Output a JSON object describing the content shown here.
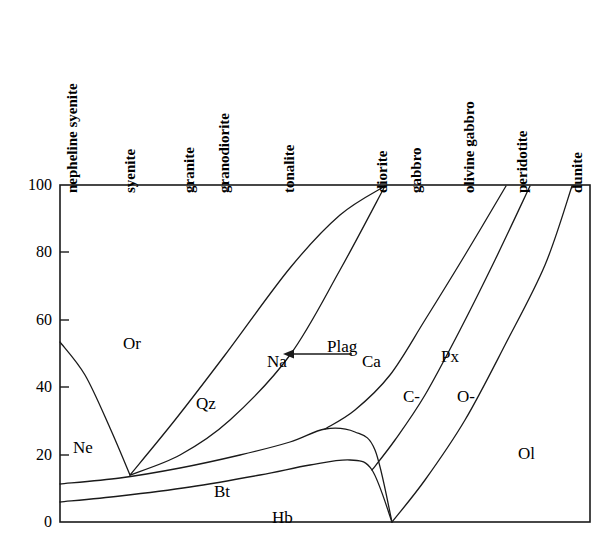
{
  "chart_data": {
    "type": "area",
    "title": "",
    "subtitle": "",
    "xlabel": "",
    "ylabel": "",
    "xlim": [
      0,
      100
    ],
    "ylim": [
      0,
      100
    ],
    "grid": false,
    "legend_position": "none",
    "x_category_labels": [
      "nepheline syenite",
      "syenite",
      "granite",
      "granodiorite",
      "tonalite",
      "diorite",
      "gabbro",
      "olivine gabbro",
      "peridotite",
      "dunite"
    ],
    "x_category_positions_px": [
      72,
      130,
      190,
      225,
      290,
      383,
      417,
      470,
      523,
      578
    ],
    "y_ticks": [
      "0",
      "20",
      "40",
      "60",
      "80",
      "100"
    ],
    "y_tick_values": [
      0,
      20,
      40,
      60,
      80,
      100
    ],
    "mineral_fields": [
      {
        "key": "Ne",
        "label": "Ne",
        "label_px": [
          73,
          438
        ]
      },
      {
        "key": "Or",
        "label": "Or",
        "label_px": [
          123,
          334
        ]
      },
      {
        "key": "Qz",
        "label": "Qz",
        "label_px": [
          196,
          394
        ]
      },
      {
        "key": "Bt",
        "label": "Bt",
        "label_px": [
          214,
          482
        ]
      },
      {
        "key": "Hb",
        "label": "Hb",
        "label_px": [
          272,
          508
        ]
      },
      {
        "key": "Plag",
        "label": "Plag",
        "label_px": [
          327,
          337
        ]
      },
      {
        "key": "Px",
        "label": "Px",
        "label_px": [
          441,
          347
        ]
      },
      {
        "key": "C-",
        "label": "C-",
        "label_px": [
          403,
          387
        ]
      },
      {
        "key": "O-",
        "label": "O-",
        "label_px": [
          457,
          387
        ]
      },
      {
        "key": "Ol",
        "label": "Ol",
        "label_px": [
          518,
          444
        ]
      }
    ],
    "annotation": {
      "from_label": "Ca",
      "to_label": "Na",
      "arrow_direction": "left",
      "na_px": [
        267,
        352
      ],
      "ca_px": [
        362,
        352
      ],
      "arrow_x1_px": 352,
      "arrow_x2_px": 292,
      "arrow_y_px": 354
    },
    "plot_box_px": {
      "left": 60,
      "top": 185,
      "right": 590,
      "bottom": 522
    },
    "boundaries": [
      {
        "name": "nepheline-upper",
        "description": "Ne field upper boundary from left axis down to V point",
        "points_px": [
          [
            60,
            342
          ],
          [
            85,
            375
          ],
          [
            110,
            428
          ],
          [
            130,
            475
          ]
        ]
      },
      {
        "name": "orthoclase-quartz",
        "description": "Or / Qz boundary from V point up to diorite apex",
        "points_px": [
          [
            130,
            475
          ],
          [
            175,
            420
          ],
          [
            225,
            355
          ],
          [
            290,
            268
          ],
          [
            340,
            215
          ],
          [
            385,
            186
          ]
        ]
      },
      {
        "name": "quartz-plagioclase",
        "description": "Qz / Plag boundary from V point up to diorite apex",
        "points_px": [
          [
            130,
            475
          ],
          [
            180,
            455
          ],
          [
            230,
            420
          ],
          [
            290,
            355
          ],
          [
            340,
            270
          ],
          [
            385,
            186
          ]
        ]
      },
      {
        "name": "biotite-upper",
        "description": "Upper boundary of Bt field",
        "points_px": [
          [
            60,
            484
          ],
          [
            120,
            478
          ],
          [
            180,
            468
          ],
          [
            240,
            455
          ],
          [
            290,
            442
          ],
          [
            325,
            429
          ],
          [
            355,
            432
          ],
          [
            375,
            450
          ],
          [
            392,
            522
          ]
        ]
      },
      {
        "name": "hornblende-upper",
        "description": "Upper boundary of Hb field (lower bound of Bt)",
        "points_px": [
          [
            60,
            502
          ],
          [
            120,
            496
          ],
          [
            190,
            487
          ],
          [
            260,
            475
          ],
          [
            310,
            465
          ],
          [
            350,
            460
          ],
          [
            372,
            470
          ],
          [
            392,
            522
          ]
        ]
      },
      {
        "name": "plag-cpx",
        "description": "Plagioclase / clinopyroxene boundary",
        "points_px": [
          [
            325,
            429
          ],
          [
            355,
            410
          ],
          [
            390,
            375
          ],
          [
            425,
            320
          ],
          [
            465,
            255
          ],
          [
            506,
            186
          ]
        ]
      },
      {
        "name": "cpx-opx",
        "description": "Clinopyroxene / orthopyroxene boundary",
        "points_px": [
          [
            372,
            470
          ],
          [
            395,
            440
          ],
          [
            425,
            395
          ],
          [
            460,
            330
          ],
          [
            495,
            260
          ],
          [
            530,
            186
          ]
        ]
      },
      {
        "name": "px-olivine",
        "description": "Pyroxene / olivine boundary",
        "points_px": [
          [
            392,
            522
          ],
          [
            425,
            480
          ],
          [
            465,
            420
          ],
          [
            505,
            345
          ],
          [
            545,
            265
          ],
          [
            572,
            186
          ]
        ]
      }
    ]
  },
  "axis": {
    "y_tick_labels": [
      "100",
      "80",
      "60",
      "40",
      "20",
      "0"
    ],
    "y_tick_y_px": [
      185,
      252,
      320,
      387,
      455,
      522
    ]
  },
  "rock_type_labels": [
    {
      "text": "nepheline syenite",
      "x_px": 80,
      "baseline_y_px": 178
    },
    {
      "text": "syenite",
      "x_px": 138,
      "baseline_y_px": 178
    },
    {
      "text": "granite",
      "x_px": 197,
      "baseline_y_px": 178
    },
    {
      "text": "granodiorite",
      "x_px": 232,
      "baseline_y_px": 178
    },
    {
      "text": "tonalite",
      "x_px": 297,
      "baseline_y_px": 178
    },
    {
      "text": "diorite",
      "x_px": 390,
      "baseline_y_px": 178
    },
    {
      "text": "gabbro",
      "x_px": 424,
      "baseline_y_px": 178
    },
    {
      "text": "olivine gabbro",
      "x_px": 477,
      "baseline_y_px": 178
    },
    {
      "text": "peridotite",
      "x_px": 530,
      "baseline_y_px": 178
    },
    {
      "text": "dunite",
      "x_px": 585,
      "baseline_y_px": 178
    }
  ],
  "colors": {
    "line": "#1a1a1a",
    "text": "#000000",
    "background": "#ffffff"
  }
}
